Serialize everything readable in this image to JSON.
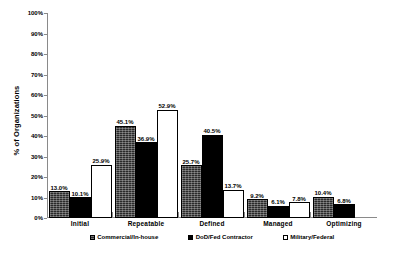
{
  "chart_data": {
    "type": "bar",
    "title": "",
    "xlabel": "",
    "ylabel": "% of Organizations",
    "ylim": [
      0,
      100
    ],
    "grid": false,
    "legend_position": "bottom",
    "categories": [
      "Initial",
      "Repeatable",
      "Defined",
      "Managed",
      "Optimizing"
    ],
    "ytick_labels": [
      "0%",
      "10%",
      "20%",
      "30%",
      "40%",
      "50%",
      "60%",
      "70%",
      "80%",
      "90%",
      "100%"
    ],
    "ytick_values": [
      0,
      10,
      20,
      30,
      40,
      50,
      60,
      70,
      80,
      90,
      100
    ],
    "series": [
      {
        "name": "Commercial/In-house",
        "fill": "dark-textured",
        "color": "#2a2a2a",
        "values": [
          13.0,
          45.1,
          25.7,
          9.2,
          10.4
        ],
        "labels": [
          "13.0%",
          "45.1%",
          "25.7%",
          "9.2%",
          "10.4%"
        ]
      },
      {
        "name": "DoD/Fed Contractor",
        "fill": "solid-black",
        "color": "#000000",
        "values": [
          10.1,
          36.9,
          40.5,
          6.1,
          6.8
        ],
        "labels": [
          "10.1%",
          "36.9%",
          "40.5%",
          "6.1%",
          "6.8%"
        ]
      },
      {
        "name": "Military/Federal",
        "fill": "white-outline",
        "color": "#ffffff",
        "values": [
          25.9,
          52.9,
          13.7,
          7.8,
          null
        ],
        "labels": [
          "25.9%",
          "52.9%",
          "13.7%",
          "7.8%",
          ""
        ]
      }
    ]
  }
}
